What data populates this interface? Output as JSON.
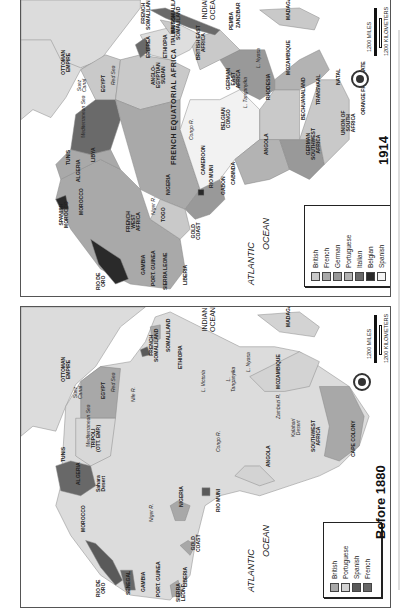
{
  "colors": {
    "British": "#c9c9c9",
    "French": "#a9a9a9",
    "German": "#999999",
    "Portuguese": "#b3b3b3",
    "Italian": "#6a6a6a",
    "Belgian": "#2a2a2a",
    "Spanish": "#f2f2f2",
    "Spanish1880": "#5a5a5a",
    "French1880": "#686868",
    "British1880": "#a8a8a8",
    "Portuguese1880": "#d3d3d3",
    "land": "#dcdcdc",
    "independent": "#dedede",
    "water": "#ffffff"
  },
  "maps": [
    {
      "id": "1914",
      "title": "1914",
      "legend": [
        {
          "label": "British",
          "color": "#c9c9c9"
        },
        {
          "label": "French",
          "color": "#a9a9a9"
        },
        {
          "label": "German",
          "color": "#999999"
        },
        {
          "label": "Portuguese",
          "color": "#b3b3b3"
        },
        {
          "label": "Italian",
          "color": "#6a6a6a"
        },
        {
          "label": "Belgian",
          "color": "#2a2a2a"
        },
        {
          "label": "Spanish",
          "color": "#f4f4f4"
        }
      ],
      "scale": {
        "miles": "1200 MILES",
        "km": "1200 KILOMETERS"
      },
      "regions": [
        {
          "name": "europe-asia",
          "fill": "#dcdcdc",
          "points": "0,0 0,120 12,110 30,118 45,98 60,70 72,62 90,25 120,0"
        },
        {
          "name": "ottoman-empire",
          "fill": "#dcdcdc",
          "points": "0,0 120,0 120,8 80,60 60,68 40,60 30,40 0,40"
        },
        {
          "name": "french-west-africa",
          "fill": "#a9a9a9",
          "points": "40,180 35,200 50,230 80,270 110,285 150,290 165,270 160,240 130,220 120,190 100,170 80,160 60,170"
        },
        {
          "name": "algeria",
          "fill": "#a9a9a9",
          "points": "35,165 40,180 60,170 80,160 100,170 90,150 70,155 50,150"
        },
        {
          "name": "libya",
          "fill": "#6a6a6a",
          "points": "50,150 70,155 90,150 100,120 95,100 75,100 55,115"
        },
        {
          "name": "egypt",
          "fill": "#c9c9c9",
          "points": "60,70 75,100 95,100 100,60 85,55"
        },
        {
          "name": "anglo-egyptian-sudan",
          "fill": "#c9c9c9",
          "points": "100,60 95,100 120,110 160,100 170,70 150,60 120,55"
        },
        {
          "name": "french-equatorial-africa",
          "fill": "#a9a9a9",
          "points": "95,100 100,120 120,190 140,200 165,210 180,190 170,160 160,130 160,100 120,110"
        },
        {
          "name": "nigeria",
          "fill": "#c9c9c9",
          "points": "130,220 140,200 165,210 170,230 160,240"
        },
        {
          "name": "cameroon",
          "fill": "#999999",
          "points": "165,210 180,190 200,180 205,200 190,215 175,220"
        },
        {
          "name": "rio-muni",
          "fill": "#2a2a2a",
          "points": "178,190 184,190 184,196 178,196"
        },
        {
          "name": "belgian-congo",
          "fill": "#f2f2f2",
          "points": "170,100 160,130 170,160 180,190 200,180 215,160 240,140 240,110 220,90 200,100"
        },
        {
          "name": "angola",
          "fill": "#b3b3b3",
          "points": "215,160 240,140 260,140 270,170 250,180 225,185"
        },
        {
          "name": "german-southwest-africa",
          "fill": "#999999",
          "points": "270,170 260,140 280,140 300,140 305,165 290,180"
        },
        {
          "name": "union-south-africa",
          "fill": "#c9c9c9",
          "points": "280,140 300,80 320,80 330,100 330,140 305,165 300,140"
        },
        {
          "name": "rhodesia",
          "fill": "#c9c9c9",
          "points": "240,140 240,110 255,90 280,90 280,140 260,140"
        },
        {
          "name": "mozambique",
          "fill": "#b3b3b3",
          "points": "255,80 280,60 300,50 310,70 300,80 280,90 255,90"
        },
        {
          "name": "german-east-africa",
          "fill": "#999999",
          "points": "200,60 220,50 245,50 255,80 255,90 240,100 220,90"
        },
        {
          "name": "british-east-africa",
          "fill": "#c9c9c9",
          "points": "170,40 200,30 220,50 200,60 180,70"
        },
        {
          "name": "ethiopia",
          "fill": "#dedede",
          "points": "120,35 160,25 180,35 170,50 150,60 130,55"
        },
        {
          "name": "italian-somaliland",
          "fill": "#6a6a6a",
          "points": "130,10 145,8 180,22 200,30 195,35 170,28 145,18"
        },
        {
          "name": "british-somaliland",
          "fill": "#c9c9c9",
          "points": "140,20 150,22 160,30 150,34"
        },
        {
          "name": "eritrea",
          "fill": "#6a6a6a",
          "points": "115,45 125,38 130,50 120,58"
        },
        {
          "name": "madagascar",
          "fill": "#c9c9c9",
          "points": "240,10 280,8 300,18 295,30 260,25"
        },
        {
          "name": "spanish-morocco",
          "fill": "#2a2a2a",
          "points": "35,200 40,210 48,210 45,196"
        },
        {
          "name": "rio-de-oro",
          "fill": "#2a2a2a",
          "points": "70,240 78,265 95,285 108,280 100,260 85,250"
        }
      ],
      "labels": [
        {
          "text": "OTTOMAN\nEMPIRE",
          "x": 40,
          "y": 75
        },
        {
          "text": "Red Sea",
          "x": 90,
          "y": 85,
          "cls": "sea"
        },
        {
          "text": "Suez\nCanal",
          "x": 56,
          "y": 92,
          "cls": "sea"
        },
        {
          "text": "ERITREA",
          "x": 125,
          "y": 58
        },
        {
          "text": "FRENCH\nSOMALILAND",
          "x": 120,
          "y": 30
        },
        {
          "text": "ITALIAN SOMALILAND",
          "x": 150,
          "y": 45
        },
        {
          "text": "INDIAN\nOCEAN",
          "x": 180,
          "y": 20,
          "cls": "oceanup"
        },
        {
          "text": "ETHIOPIA",
          "x": 142,
          "y": 58
        },
        {
          "text": "BRITISH\nSOMALILAND",
          "x": 150,
          "y": 40
        },
        {
          "text": "BRITISH EAST\nAFRICA",
          "x": 175,
          "y": 60
        },
        {
          "text": "PEMBA",
          "x": 208,
          "y": 30
        },
        {
          "text": "ZANZIBAR",
          "x": 215,
          "y": 28
        },
        {
          "text": "MADAGASCAR",
          "x": 265,
          "y": 20
        },
        {
          "text": "GERMAN\nEAST\nAFRICA",
          "x": 205,
          "y": 90
        },
        {
          "text": "L. Nyasa",
          "x": 235,
          "y": 68,
          "cls": "sea"
        },
        {
          "text": "MOZAMBIQUE",
          "x": 265,
          "y": 75
        },
        {
          "text": "NATAL",
          "x": 315,
          "y": 85
        },
        {
          "text": "TRANSVAAL",
          "x": 295,
          "y": 105
        },
        {
          "text": "ORANGE FREE STATE",
          "x": 340,
          "y": 115
        },
        {
          "text": "BECHUANALAND",
          "x": 280,
          "y": 120
        },
        {
          "text": "RHODESIA",
          "x": 245,
          "y": 100
        },
        {
          "text": "L. Tanganyika",
          "x": 222,
          "y": 108,
          "cls": "sea"
        },
        {
          "text": "BELGIAN\nCONGO",
          "x": 200,
          "y": 130
        },
        {
          "text": "Congo R.",
          "x": 168,
          "y": 140,
          "cls": "sea"
        },
        {
          "text": "UNION OF\nSOUTH\nAFRICA",
          "x": 320,
          "y": 135
        },
        {
          "text": "GERMAN\nSOUTHWEST\nAFRICA",
          "x": 285,
          "y": 160
        },
        {
          "text": "ANGOLA",
          "x": 243,
          "y": 155
        },
        {
          "text": "EGYPT",
          "x": 80,
          "y": 92
        },
        {
          "text": "ANGLO-\nEGYPTIAN\nSUDAN",
          "x": 130,
          "y": 88
        },
        {
          "text": "FRENCH EQUATORIAL AFRICA",
          "x": 150,
          "y": 165,
          "cls": "big"
        },
        {
          "text": "Mediterranean Sea",
          "x": 60,
          "y": 138,
          "cls": "sea"
        },
        {
          "text": "LIBYA",
          "x": 70,
          "y": 162
        },
        {
          "text": "TUNIS",
          "x": 45,
          "y": 165
        },
        {
          "text": "ALGERIA",
          "x": 55,
          "y": 182
        },
        {
          "text": "CAMEROON",
          "x": 180,
          "y": 175
        },
        {
          "text": "RIO MUNI",
          "x": 188,
          "y": 188
        },
        {
          "text": "GABON",
          "x": 200,
          "y": 195
        },
        {
          "text": "CABINDA",
          "x": 210,
          "y": 185
        },
        {
          "text": "NIGERIA",
          "x": 145,
          "y": 195
        },
        {
          "text": "Niger R.",
          "x": 130,
          "y": 215,
          "cls": "sea"
        },
        {
          "text": "TOGO",
          "x": 140,
          "y": 222
        },
        {
          "text": "MOROCCO",
          "x": 58,
          "y": 215
        },
        {
          "text": "SPANISH\nMOROCCO",
          "x": 38,
          "y": 228
        },
        {
          "text": "FRENCH\nWEST\nAFRICA",
          "x": 105,
          "y": 232
        },
        {
          "text": "GOLD\nCOAST",
          "x": 170,
          "y": 240
        },
        {
          "text": "RIO DE\nORO",
          "x": 75,
          "y": 290
        },
        {
          "text": "GAMBIA",
          "x": 120,
          "y": 275
        },
        {
          "text": "PORT. GUINEA",
          "x": 130,
          "y": 286
        },
        {
          "text": "SIERRA LEONE",
          "x": 142,
          "y": 290
        },
        {
          "text": "LIBERIA",
          "x": 162,
          "y": 285
        },
        {
          "text": "ATLANTIC",
          "x": 225,
          "y": 285,
          "cls": "ocean"
        },
        {
          "text": "OCEAN",
          "x": 240,
          "y": 250,
          "cls": "ocean"
        }
      ]
    },
    {
      "id": "1880",
      "title": "Before 1880",
      "legend": [
        {
          "label": "British",
          "color": "#a8a8a8"
        },
        {
          "label": "Portuguese",
          "color": "#d3d3d3"
        },
        {
          "label": "Spanish",
          "color": "#5a5a5a"
        },
        {
          "label": "French",
          "color": "#686868"
        }
      ],
      "scale": {
        "miles": "1200 MILES",
        "km": "1200 KILOMETERS"
      },
      "regions": [
        {
          "name": "europe-asia",
          "fill": "#dcdcdc",
          "points": "0,0 0,130 12,120 35,125 45,100 55,78 75,60 100,20 125,0"
        },
        {
          "name": "africa-mainland",
          "fill": "#dcdcdc",
          "points": "45,100 40,180 35,200 50,230 80,270 110,290 150,295 170,270 175,240 185,200 200,190 220,185 240,190 270,180 300,170 320,160 340,140 350,110 330,80 300,60 280,45 255,40 220,40 200,30 170,15 150,5 135,10 125,35 110,55 80,60 60,75"
        },
        {
          "name": "egypt",
          "fill": "#a8a8a8",
          "points": "60,75 60,112 95,112 100,62 80,60"
        },
        {
          "name": "tripoli",
          "fill": "#d8d8d8",
          "points": "55,112 55,150 70,160 90,150 95,112"
        },
        {
          "name": "algeria",
          "fill": "#686868",
          "points": "35,160 40,185 60,190 75,180 70,160 50,155"
        },
        {
          "name": "senegal",
          "fill": "#686868",
          "points": "100,265 105,285 115,285 112,265"
        },
        {
          "name": "rio-de-oro",
          "fill": "#5a5a5a",
          "points": "65,235 80,262 95,280 102,275 92,255 75,238"
        },
        {
          "name": "gold-coast",
          "fill": "#a8a8a8",
          "points": "160,240 168,235 175,240 170,250"
        },
        {
          "name": "nigeria",
          "fill": "#a8a8a8",
          "points": "150,200 158,195 170,200 165,215 155,215"
        },
        {
          "name": "sierra-leone",
          "fill": "#a8a8a8",
          "points": "150,280 158,275 162,290 152,292"
        },
        {
          "name": "rio-muni",
          "fill": "#5a5a5a",
          "points": "182,182 190,182 190,190 182,190"
        },
        {
          "name": "angola",
          "fill": "#d3d3d3",
          "points": "215,170 240,180 255,175 240,160 225,160"
        },
        {
          "name": "mozambique",
          "fill": "#d3d3d3",
          "points": "230,70 250,60 280,45 300,55 290,80 265,85 245,85"
        },
        {
          "name": "cape-colony",
          "fill": "#a8a8a8",
          "points": "300,80 330,80 345,110 340,140 320,155 305,150 310,120"
        },
        {
          "name": "french-somaliland",
          "fill": "#5a5a5a",
          "points": "120,43 127,40 130,48 122,50"
        },
        {
          "name": "somaliland",
          "fill": "#a8a8a8",
          "points": "130,20 140,18 140,32 132,35"
        },
        {
          "name": "madagascar",
          "fill": "#d3d3d3",
          "points": "238,8 280,5 300,20 295,30 260,25"
        }
      ],
      "labels": [
        {
          "text": "OTTOMAN\nEMPIRE",
          "x": 40,
          "y": 75
        },
        {
          "text": "Red Sea",
          "x": 90,
          "y": 85,
          "cls": "sea"
        },
        {
          "text": "Suez\nCanal",
          "x": 52,
          "y": 92,
          "cls": "sea"
        },
        {
          "text": "FRENCH\nSOMALILAND",
          "x": 128,
          "y": 55
        },
        {
          "text": "SOMALILAND",
          "x": 145,
          "y": 45
        },
        {
          "text": "INDIAN\nOCEAN",
          "x": 180,
          "y": 25,
          "cls": "oceanup"
        },
        {
          "text": "ETHIOPIA",
          "x": 157,
          "y": 62
        },
        {
          "text": "Nile R.",
          "x": 110,
          "y": 95,
          "cls": "sea"
        },
        {
          "text": "L. Victoria",
          "x": 180,
          "y": 85,
          "cls": "sea"
        },
        {
          "text": "L.\nTanganyika",
          "x": 205,
          "y": 85,
          "cls": "sea"
        },
        {
          "text": "L. Nyasa",
          "x": 225,
          "y": 65,
          "cls": "sea"
        },
        {
          "text": "MADAGASCAR",
          "x": 265,
          "y": 20
        },
        {
          "text": "MOZAMBIQUE",
          "x": 255,
          "y": 82
        },
        {
          "text": "Zambezi R.",
          "x": 255,
          "y": 112,
          "cls": "sea"
        },
        {
          "text": "Congo R.",
          "x": 195,
          "y": 145,
          "cls": "sea"
        },
        {
          "text": "EGYPT",
          "x": 80,
          "y": 92
        },
        {
          "text": "Mediterranean Sea",
          "x": 65,
          "y": 140,
          "cls": "sea"
        },
        {
          "text": "TRIPOLI\n(OTT. EMP.)",
          "x": 70,
          "y": 145
        },
        {
          "text": "TUNIS",
          "x": 40,
          "y": 155
        },
        {
          "text": "ALGERIA",
          "x": 55,
          "y": 178
        },
        {
          "text": "Sahara\nDesert",
          "x": 75,
          "y": 185
        },
        {
          "text": "Kalahari\nDesert",
          "x": 270,
          "y": 130,
          "cls": "sea"
        },
        {
          "text": "SOUTHWEST\nAFRICA",
          "x": 290,
          "y": 145
        },
        {
          "text": "ANGOLA",
          "x": 245,
          "y": 160
        },
        {
          "text": "CAPE COLONY",
          "x": 330,
          "y": 150
        },
        {
          "text": "NIGERIA",
          "x": 158,
          "y": 200
        },
        {
          "text": "Niger R.",
          "x": 128,
          "y": 215,
          "cls": "sea"
        },
        {
          "text": "RIO MUNI",
          "x": 195,
          "y": 205
        },
        {
          "text": "GOLD\nCOAST",
          "x": 170,
          "y": 245
        },
        {
          "text": "MOROCCO",
          "x": 60,
          "y": 225
        },
        {
          "text": "RIO DE\nORO",
          "x": 75,
          "y": 290
        },
        {
          "text": "SENEGAL",
          "x": 105,
          "y": 288
        },
        {
          "text": "GAMBIA",
          "x": 120,
          "y": 285
        },
        {
          "text": "PORT. GUINEA",
          "x": 135,
          "y": 290
        },
        {
          "text": "LIBERIA",
          "x": 162,
          "y": 280
        },
        {
          "text": "SIERRA\nLEONE",
          "x": 155,
          "y": 295
        },
        {
          "text": "ATLANTIC",
          "x": 225,
          "y": 285,
          "cls": "ocean"
        },
        {
          "text": "OCEAN",
          "x": 240,
          "y": 250,
          "cls": "ocean"
        }
      ]
    }
  ]
}
